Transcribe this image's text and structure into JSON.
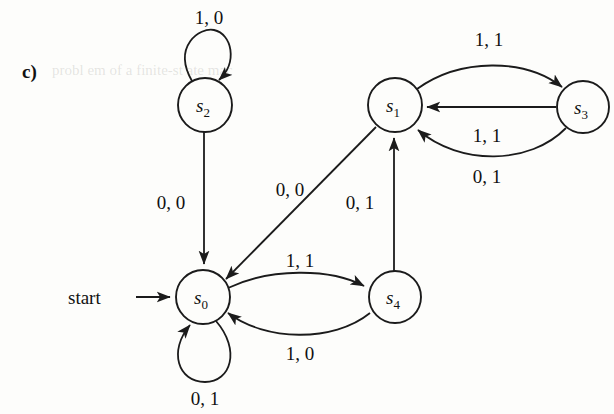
{
  "figure": {
    "part_label": "c)",
    "start_label": "start",
    "caption_ghost": "probl   em   of   a   finite-st   ate   mac"
  },
  "diagram": {
    "type": "finite-state-machine",
    "nodes": [
      {
        "id": "s0",
        "label": "s",
        "subscript": "0",
        "cx": 203,
        "cy": 297,
        "r": 27,
        "is_start": true
      },
      {
        "id": "s1",
        "label": "s",
        "subscript": "1",
        "cx": 395,
        "cy": 105,
        "r": 27,
        "is_start": false
      },
      {
        "id": "s2",
        "label": "s",
        "subscript": "2",
        "cx": 205,
        "cy": 105,
        "r": 27,
        "is_start": false
      },
      {
        "id": "s3",
        "label": "s",
        "subscript": "3",
        "cx": 583,
        "cy": 107,
        "r": 26,
        "is_start": false
      },
      {
        "id": "s4",
        "label": "s",
        "subscript": "4",
        "cx": 395,
        "cy": 297,
        "r": 26,
        "is_start": false
      }
    ],
    "edges": [
      {
        "id": "e-s2-self",
        "from": "s2",
        "to": "s2",
        "label": "1, 0",
        "label_x": 209,
        "label_y": 24,
        "shape": "self-loop-top"
      },
      {
        "id": "e-s2-s0",
        "from": "s2",
        "to": "s0",
        "label": "0, 0",
        "label_x": 171,
        "label_y": 209,
        "shape": "straight-vertical"
      },
      {
        "id": "e-s1-s0",
        "from": "s1",
        "to": "s0",
        "label": "0, 0",
        "label_x": 290,
        "label_y": 196,
        "shape": "diagonal"
      },
      {
        "id": "e-s1-s3",
        "from": "s1",
        "to": "s3",
        "label": "1, 1",
        "label_x": 489,
        "label_y": 46,
        "shape": "curve-top"
      },
      {
        "id": "e-s3-s1-straight",
        "from": "s3",
        "to": "s1",
        "label": "1, 1",
        "label_x": 487,
        "label_y": 142,
        "shape": "straight-horizontal"
      },
      {
        "id": "e-s3-s1-curve",
        "from": "s3",
        "to": "s1",
        "label": "0, 1",
        "label_x": 487,
        "label_y": 183,
        "shape": "curve-bottom"
      },
      {
        "id": "e-s4-s1",
        "from": "s4",
        "to": "s1",
        "label": "0, 1",
        "label_x": 360,
        "label_y": 209,
        "shape": "straight-vertical-up"
      },
      {
        "id": "e-s0-s4",
        "from": "s0",
        "to": "s4",
        "label": "1, 1",
        "label_x": 300,
        "label_y": 267,
        "shape": "curve-top"
      },
      {
        "id": "e-s4-s0",
        "from": "s4",
        "to": "s0",
        "label": "1, 0",
        "label_x": 300,
        "label_y": 360,
        "shape": "curve-bottom"
      },
      {
        "id": "e-s0-self",
        "from": "s0",
        "to": "s0",
        "label": "0, 1",
        "label_x": 205,
        "label_y": 405,
        "shape": "self-loop-bottom"
      }
    ],
    "start_arrow": {
      "label": "start",
      "text_x": 68,
      "text_y": 304,
      "line_from_x": 136,
      "line_to_x": 174,
      "line_y": 297
    },
    "colors": {
      "stroke": "#1b1b1b",
      "text": "#111111",
      "background": "#fdfdfb"
    }
  }
}
